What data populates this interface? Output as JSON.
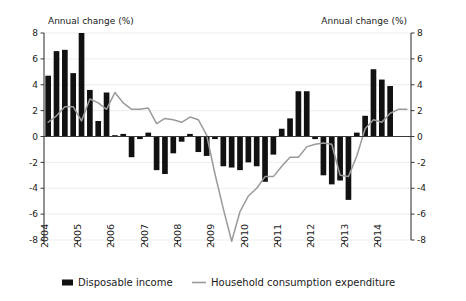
{
  "chart_data": {
    "type": "bar",
    "title": "",
    "left_axis_title": "Annual change (%)",
    "right_axis_title": "Annual change (%)",
    "xlabel": "",
    "ylabel": "Annual change (%)",
    "ylim": [
      -8,
      8
    ],
    "y_ticks": [
      8,
      6,
      4,
      2,
      0,
      -2,
      -4,
      -6,
      -8
    ],
    "y_tick_labels": [
      "8",
      "6",
      "4",
      "2",
      "0",
      "-2",
      "-4",
      "-6",
      "-8"
    ],
    "grid": true,
    "legend_position": "bottom",
    "x_tick_labels": [
      "2004",
      "2005",
      "2006",
      "2007",
      "2008",
      "2009",
      "2010",
      "2011",
      "2012",
      "2013",
      "2014"
    ],
    "x_axis_note": "Quarterly observations, 2004 Q1 to 2014 Q4",
    "categories": [
      "2004Q1",
      "2004Q2",
      "2004Q3",
      "2004Q4",
      "2005Q1",
      "2005Q2",
      "2005Q3",
      "2005Q4",
      "2006Q1",
      "2006Q2",
      "2006Q3",
      "2006Q4",
      "2007Q1",
      "2007Q2",
      "2007Q3",
      "2007Q4",
      "2008Q1",
      "2008Q2",
      "2008Q3",
      "2008Q4",
      "2009Q1",
      "2009Q2",
      "2009Q3",
      "2009Q4",
      "2010Q1",
      "2010Q2",
      "2010Q3",
      "2010Q4",
      "2011Q1",
      "2011Q2",
      "2011Q3",
      "2011Q4",
      "2012Q1",
      "2012Q2",
      "2012Q3",
      "2012Q4",
      "2013Q1",
      "2013Q2",
      "2013Q3",
      "2013Q4",
      "2014Q1",
      "2014Q2",
      "2014Q3",
      "2014Q4"
    ],
    "series": [
      {
        "name": "Disposable income",
        "type": "bar",
        "color": "#111111",
        "values": [
          4.7,
          6.6,
          6.7,
          4.9,
          8.0,
          3.6,
          1.2,
          3.4,
          0.1,
          0.2,
          -1.6,
          -0.2,
          0.3,
          -2.6,
          -2.9,
          -1.3,
          -0.4,
          0.2,
          -1.2,
          -1.5,
          -0.2,
          -2.3,
          -2.4,
          -2.6,
          -2.0,
          -2.3,
          -3.5,
          -1.4,
          0.6,
          1.4,
          3.5,
          3.5,
          -0.2,
          -3.0,
          -3.7,
          -3.4,
          -4.9,
          0.3,
          1.6,
          5.2,
          4.4,
          3.9,
          0.0,
          0.0
        ]
      },
      {
        "name": "Household consumption expenditure",
        "type": "line",
        "color": "#9a9a9a",
        "values": [
          1.1,
          1.6,
          2.3,
          2.3,
          1.2,
          2.9,
          2.6,
          2.1,
          3.4,
          2.6,
          2.1,
          2.1,
          2.2,
          1.0,
          1.4,
          1.3,
          1.1,
          1.5,
          1.3,
          0.1,
          -2.9,
          -5.6,
          -8.1,
          -5.8,
          -4.6,
          -4.0,
          -3.1,
          -3.1,
          -2.3,
          -1.6,
          -1.6,
          -0.8,
          -0.6,
          -0.5,
          -0.6,
          -3.0,
          -3.1,
          -1.5,
          0.6,
          1.3,
          1.1,
          1.8,
          2.1,
          2.1
        ]
      }
    ],
    "legend": [
      {
        "label": "Disposable income",
        "marker": "bar-swatch",
        "color": "#111111"
      },
      {
        "label": "Household consumption expenditure",
        "marker": "line-swatch",
        "color": "#9a9a9a"
      }
    ]
  }
}
